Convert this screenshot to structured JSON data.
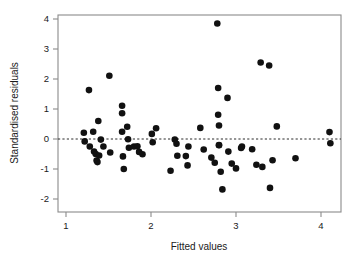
{
  "chart_data": {
    "type": "scatter",
    "title": "",
    "xlabel": "Fitted values",
    "ylabel": "Standardised residuals",
    "xlim": [
      0.9,
      4.28
    ],
    "ylim": [
      -2.15,
      4.15
    ],
    "xticks": [
      1,
      2,
      3,
      4
    ],
    "xticklabels": [
      "1",
      "2",
      "3",
      "4"
    ],
    "yticks": [
      -2,
      -1,
      0,
      1,
      2,
      3,
      4
    ],
    "yticklabels": [
      "-2",
      "-1",
      "0",
      "1",
      "2",
      "3",
      "4"
    ],
    "grid": false,
    "legend": null,
    "reference_lines": [
      {
        "name": "zero-residual-line",
        "orientation": "horizontal",
        "y": 0,
        "style": "dashed"
      }
    ],
    "marker": {
      "shape": "circle",
      "color": "#111111",
      "size": 4.6
    },
    "n_points": 72,
    "points": [
      {
        "x": 1.21,
        "y": 0.21
      },
      {
        "x": 1.22,
        "y": -0.08
      },
      {
        "x": 1.27,
        "y": 1.63
      },
      {
        "x": 1.28,
        "y": -0.25
      },
      {
        "x": 1.32,
        "y": 0.24
      },
      {
        "x": 1.33,
        "y": -0.42
      },
      {
        "x": 1.35,
        "y": -0.5
      },
      {
        "x": 1.36,
        "y": -0.72
      },
      {
        "x": 1.37,
        "y": -0.77
      },
      {
        "x": 1.38,
        "y": 0.6
      },
      {
        "x": 1.39,
        "y": -0.55
      },
      {
        "x": 1.41,
        "y": -0.02
      },
      {
        "x": 1.44,
        "y": -0.25
      },
      {
        "x": 1.51,
        "y": 2.11
      },
      {
        "x": 1.52,
        "y": -0.45
      },
      {
        "x": 1.66,
        "y": 1.11
      },
      {
        "x": 1.66,
        "y": 0.86
      },
      {
        "x": 1.66,
        "y": 0.24
      },
      {
        "x": 1.67,
        "y": -0.58
      },
      {
        "x": 1.68,
        "y": -1.0
      },
      {
        "x": 1.72,
        "y": 0.41
      },
      {
        "x": 1.73,
        "y": -0.01
      },
      {
        "x": 1.74,
        "y": -0.29
      },
      {
        "x": 1.8,
        "y": -0.25
      },
      {
        "x": 1.84,
        "y": -0.24
      },
      {
        "x": 1.86,
        "y": -0.43
      },
      {
        "x": 1.9,
        "y": -0.51
      },
      {
        "x": 2.01,
        "y": 0.17
      },
      {
        "x": 2.02,
        "y": -0.11
      },
      {
        "x": 2.06,
        "y": 0.36
      },
      {
        "x": 2.23,
        "y": -1.06
      },
      {
        "x": 2.28,
        "y": -0.02
      },
      {
        "x": 2.3,
        "y": -0.16
      },
      {
        "x": 2.31,
        "y": -0.56
      },
      {
        "x": 2.41,
        "y": -0.57
      },
      {
        "x": 2.43,
        "y": -0.88
      },
      {
        "x": 2.44,
        "y": -0.25
      },
      {
        "x": 2.58,
        "y": 0.37
      },
      {
        "x": 2.62,
        "y": -0.35
      },
      {
        "x": 2.71,
        "y": -0.62
      },
      {
        "x": 2.75,
        "y": -0.79
      },
      {
        "x": 2.78,
        "y": 3.85
      },
      {
        "x": 2.79,
        "y": 1.7
      },
      {
        "x": 2.79,
        "y": 0.81
      },
      {
        "x": 2.8,
        "y": 0.45
      },
      {
        "x": 2.8,
        "y": -0.21
      },
      {
        "x": 2.8,
        "y": -0.2
      },
      {
        "x": 2.82,
        "y": -1.09
      },
      {
        "x": 2.84,
        "y": -1.68
      },
      {
        "x": 2.9,
        "y": 1.37
      },
      {
        "x": 2.91,
        "y": -0.42
      },
      {
        "x": 2.95,
        "y": -0.82
      },
      {
        "x": 3.0,
        "y": -0.98
      },
      {
        "x": 3.06,
        "y": -0.3
      },
      {
        "x": 3.07,
        "y": -0.25
      },
      {
        "x": 3.19,
        "y": -0.34
      },
      {
        "x": 3.24,
        "y": -0.86
      },
      {
        "x": 3.29,
        "y": 2.55
      },
      {
        "x": 3.31,
        "y": -0.93
      },
      {
        "x": 3.39,
        "y": 2.45
      },
      {
        "x": 3.4,
        "y": -1.63
      },
      {
        "x": 3.43,
        "y": -0.71
      },
      {
        "x": 3.48,
        "y": 0.42
      },
      {
        "x": 3.7,
        "y": -0.64
      },
      {
        "x": 4.1,
        "y": 0.23
      },
      {
        "x": 4.11,
        "y": -0.14
      }
    ]
  },
  "geometry": {
    "plot_left": 58,
    "plot_right": 341,
    "plot_top": 15,
    "plot_bottom": 212,
    "x_at_1": 66,
    "px_per_x_unit": 85,
    "y_at_0": 139,
    "px_per_y_unit": 30
  }
}
